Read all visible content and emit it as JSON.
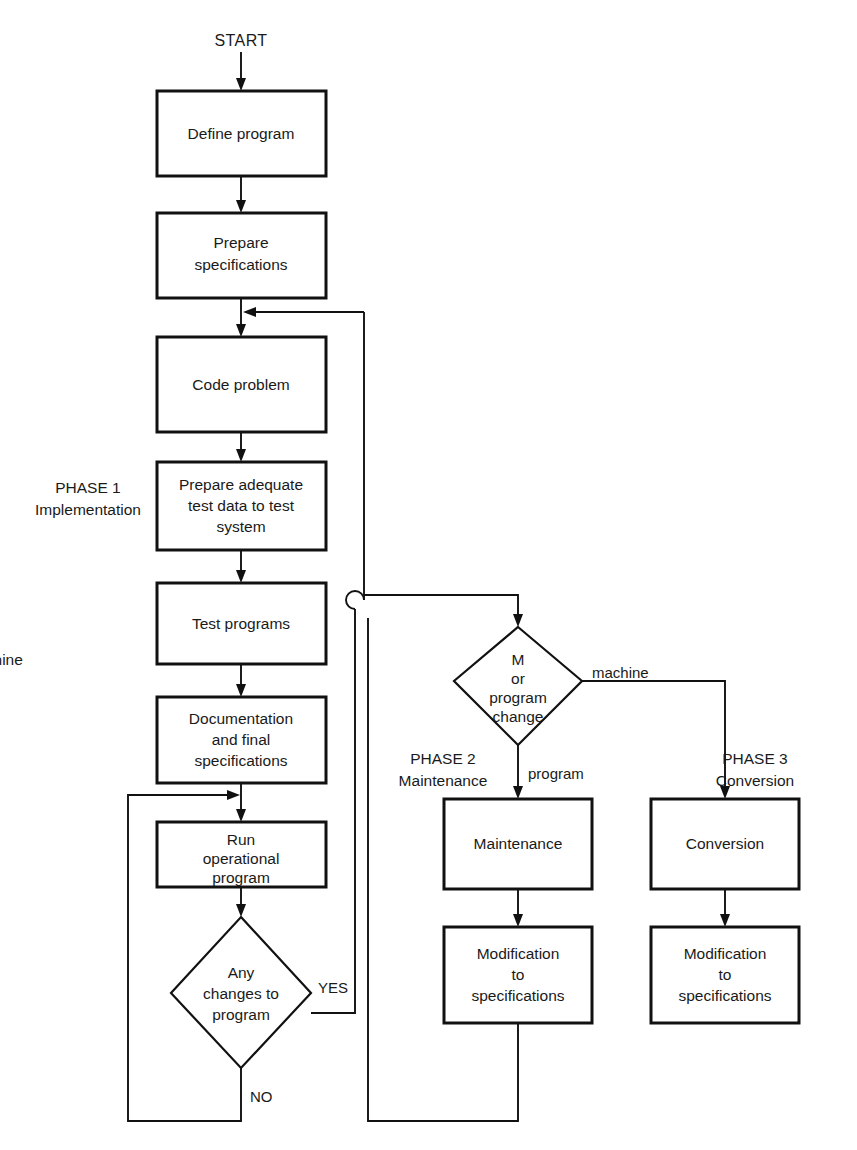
{
  "diagram": {
    "start_label": "START",
    "background_color": "#ffffff",
    "line_color": "#111111",
    "text_color": "#1a1a1a"
  },
  "phases": [
    {
      "id": "phase1",
      "number": "PHASE 1",
      "name": "Implementation"
    },
    {
      "id": "phase2",
      "number": "PHASE 2",
      "name": "Maintenance"
    },
    {
      "id": "phase3",
      "number": "PHASE 3",
      "name": "Conversion"
    }
  ],
  "nodes": [
    {
      "id": "define",
      "shape": "process",
      "lines": [
        "Define program"
      ]
    },
    {
      "id": "prepare_spec",
      "shape": "process",
      "lines": [
        "Prepare",
        "specifications"
      ]
    },
    {
      "id": "code",
      "shape": "process",
      "lines": [
        "Code problem"
      ]
    },
    {
      "id": "test_data",
      "shape": "process",
      "lines": [
        "Prepare adequate",
        "test data to test",
        "system"
      ]
    },
    {
      "id": "test_programs",
      "shape": "process",
      "lines": [
        "Test programs"
      ]
    },
    {
      "id": "documentation",
      "shape": "process",
      "lines": [
        "Documentation",
        "and final",
        "specifications"
      ]
    },
    {
      "id": "run",
      "shape": "process",
      "lines": [
        "Run",
        "operational",
        "program"
      ]
    },
    {
      "id": "any_changes",
      "shape": "decision",
      "lines": [
        "Any",
        "changes to",
        "program"
      ]
    },
    {
      "id": "machine_or_program",
      "shape": "decision",
      "lines": [
        "Machine",
        "or",
        "program",
        "change"
      ]
    },
    {
      "id": "maintenance",
      "shape": "process",
      "lines": [
        "Maintenance"
      ]
    },
    {
      "id": "mod_spec_2",
      "shape": "process",
      "lines": [
        "Modification",
        "to",
        "specifications"
      ]
    },
    {
      "id": "conversion",
      "shape": "process",
      "lines": [
        "Conversion"
      ]
    },
    {
      "id": "mod_spec_3",
      "shape": "process",
      "lines": [
        "Modification",
        "to",
        "specifications"
      ]
    }
  ],
  "edge_labels": {
    "yes": "YES",
    "no": "NO",
    "machine": "machine",
    "program": "program"
  },
  "edges": [
    {
      "from": "start",
      "to": "define",
      "label": ""
    },
    {
      "from": "define",
      "to": "prepare_spec",
      "label": ""
    },
    {
      "from": "prepare_spec",
      "to": "code",
      "label": ""
    },
    {
      "from": "code",
      "to": "test_data",
      "label": ""
    },
    {
      "from": "test_data",
      "to": "test_programs",
      "label": ""
    },
    {
      "from": "test_programs",
      "to": "documentation",
      "label": ""
    },
    {
      "from": "documentation",
      "to": "run",
      "label": ""
    },
    {
      "from": "run",
      "to": "any_changes",
      "label": ""
    },
    {
      "from": "any_changes",
      "to": "machine_or_program",
      "label": "YES"
    },
    {
      "from": "any_changes",
      "to": "run",
      "label": "NO"
    },
    {
      "from": "machine_or_program",
      "to": "conversion",
      "label": "machine"
    },
    {
      "from": "machine_or_program",
      "to": "maintenance",
      "label": "program"
    },
    {
      "from": "maintenance",
      "to": "mod_spec_2",
      "label": ""
    },
    {
      "from": "conversion",
      "to": "mod_spec_3",
      "label": ""
    },
    {
      "from": "mod_spec_2",
      "to": "code",
      "label": ""
    }
  ]
}
